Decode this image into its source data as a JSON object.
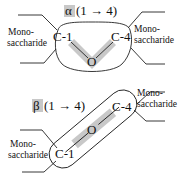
{
  "diagram": {
    "alpha": {
      "symbol": "α",
      "linkage": "(1 → 4)",
      "left_carbon": "C-1",
      "right_carbon": "C-4",
      "bridge_atom": "O",
      "left_group": [
        "Mono-",
        "saccharide"
      ],
      "right_group": [
        "Mono-",
        "saccharide"
      ]
    },
    "beta": {
      "symbol": "β",
      "linkage": "(1 → 4)",
      "left_carbon": "C-1",
      "right_carbon": "C-4",
      "bridge_atom": "O",
      "left_group": [
        "Mono-",
        "saccharide"
      ],
      "right_group": [
        "Mono-",
        "saccharide"
      ]
    },
    "colors": {
      "highlight": "#c8c8c8",
      "stroke": "#222222"
    }
  }
}
